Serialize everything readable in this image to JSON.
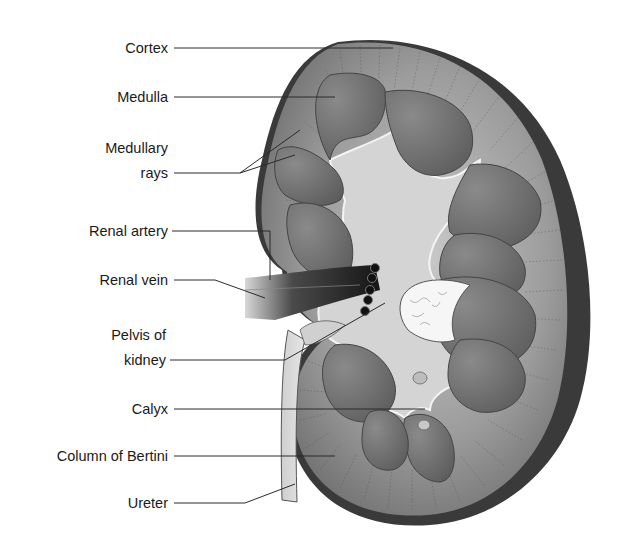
{
  "diagram": {
    "labels": [
      {
        "id": "cortex",
        "text": "Cortex"
      },
      {
        "id": "medulla",
        "text": "Medulla"
      },
      {
        "id": "medullary-rays",
        "text": "Medullary",
        "text2": "rays"
      },
      {
        "id": "renal-artery",
        "text": "Renal artery"
      },
      {
        "id": "renal-vein",
        "text": "Renal vein"
      },
      {
        "id": "pelvis",
        "text": "Pelvis of",
        "text2": "kidney"
      },
      {
        "id": "calyx",
        "text": "Calyx"
      },
      {
        "id": "column-bertini",
        "text": "Column of Bertini"
      },
      {
        "id": "ureter",
        "text": "Ureter"
      }
    ],
    "colors": {
      "capsule_dark": "#3a3a3a",
      "cortex": "#9a9a9a",
      "pyramid": "#6e6e6e",
      "sinus": "#d6d6d6",
      "vessel": "#1e1e1e",
      "fat": "#f4f4f4",
      "label_text": "#1a1a1a"
    }
  }
}
